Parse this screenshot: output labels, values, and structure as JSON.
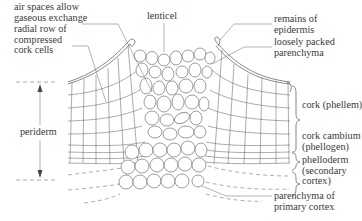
{
  "diagram": {
    "labels": {
      "air_spaces": [
        "air spaces allow",
        "gaseous exchange"
      ],
      "radial_row": [
        "radial row of",
        "compressed",
        "cork cells"
      ],
      "periderm": "periderm",
      "lenticel": "lenticel",
      "remains_epidermis": [
        "remains of",
        "epidermis"
      ],
      "loosely_packed": [
        "loosely packed",
        "parenchyma"
      ],
      "cork_phellem": "cork (phellem)",
      "cork_cambium": [
        "cork cambium",
        "(phellogen)"
      ],
      "phelloderm": [
        "phelloderm",
        "(secondary",
        "cortex)"
      ],
      "parenchyma_primary": [
        "parenchyma of",
        "primary cortex"
      ]
    },
    "colors": {
      "line": "#555555",
      "text": "#3a3a3a",
      "background": "#ffffff"
    }
  }
}
